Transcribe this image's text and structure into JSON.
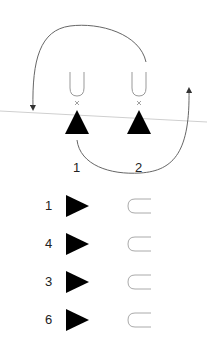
{
  "top_section": {
    "labels": [
      "1",
      "2"
    ],
    "positions": [
      {
        "label": "1",
        "x": 77
      },
      {
        "label": "2",
        "x": 139
      }
    ]
  },
  "list": {
    "items": [
      {
        "number": "1"
      },
      {
        "number": "4"
      },
      {
        "number": "3"
      },
      {
        "number": "6"
      }
    ]
  },
  "colors": {
    "triangle": "#000000",
    "outline": "#9a9a9a",
    "arrow": "#555555",
    "baseline": "#cccccc"
  }
}
